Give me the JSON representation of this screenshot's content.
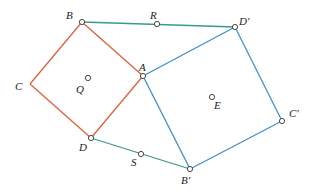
{
  "colors": {
    "orange": "#d9623c",
    "blue": "#3f8fc4",
    "green": "#3a9a8a",
    "point": "#333333"
  },
  "points": {
    "A": {
      "label": "A"
    },
    "B": {
      "label": "B"
    },
    "C": {
      "label": "C"
    },
    "D": {
      "label": "D"
    },
    "Q": {
      "label": "Q"
    },
    "R": {
      "label": "R"
    },
    "S": {
      "label": "S"
    },
    "Dp": {
      "label": "D′"
    },
    "Bp": {
      "label": "B′"
    },
    "Cp": {
      "label": "C′"
    },
    "E": {
      "label": "E"
    }
  },
  "segments": [
    {
      "from": "B",
      "to": "A",
      "color": "orange"
    },
    {
      "from": "A",
      "to": "D",
      "color": "orange"
    },
    {
      "from": "D",
      "to": "C",
      "color": "orange"
    },
    {
      "from": "C",
      "to": "B",
      "color": "orange"
    },
    {
      "from": "A",
      "to": "Dp",
      "color": "blue"
    },
    {
      "from": "Dp",
      "to": "Cp",
      "color": "blue"
    },
    {
      "from": "Cp",
      "to": "Bp",
      "color": "blue"
    },
    {
      "from": "Bp",
      "to": "A",
      "color": "blue"
    },
    {
      "from": "B",
      "to": "Dp",
      "color": "green"
    },
    {
      "from": "D",
      "to": "Bp",
      "color": "green"
    }
  ],
  "circled": [
    "B",
    "R",
    "Dp",
    "A",
    "Q",
    "E",
    "Cp",
    "Bp",
    "S",
    "D"
  ]
}
